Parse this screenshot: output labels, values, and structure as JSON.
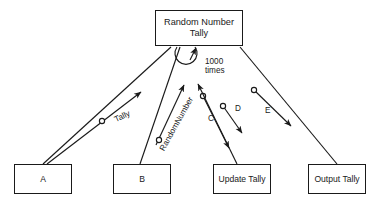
{
  "diagram": {
    "stroke_color": "#1a1a1a",
    "background_color": "#ffffff",
    "boxes": [
      {
        "id": "top",
        "label": "Random Number\nTally"
      },
      {
        "id": "a",
        "label": "A"
      },
      {
        "id": "b",
        "label": "B"
      },
      {
        "id": "update",
        "label": "Update Tally"
      },
      {
        "id": "output",
        "label": "Output Tally"
      }
    ],
    "edge_labels": [
      {
        "id": "tally",
        "text": "Tally"
      },
      {
        "id": "randomnumber",
        "text": "RandomNumber"
      },
      {
        "id": "times",
        "text": "1000\ntimes"
      },
      {
        "id": "c",
        "text": "C"
      },
      {
        "id": "d",
        "text": "D"
      },
      {
        "id": "e",
        "text": "E"
      }
    ]
  }
}
